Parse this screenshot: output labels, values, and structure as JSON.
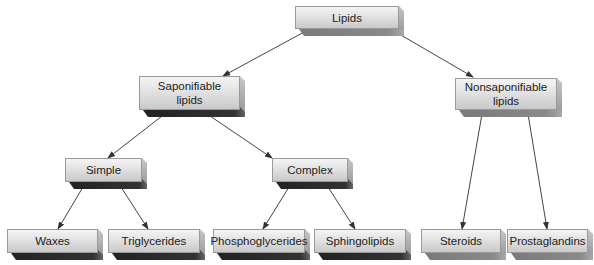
{
  "diagram": {
    "type": "hierarchy-tree",
    "root": "Lipids",
    "colors": {
      "face_top": "#f4f4f4",
      "face_bottom": "#c9c9c9",
      "dark_shadow": "#222222",
      "light_shadow": "#7a7a7a",
      "arrow": "#333333",
      "text": "#222222"
    },
    "nodes": {
      "lipids": {
        "label": "Lipids"
      },
      "saponifiable": {
        "label_line1": "Saponifiable",
        "label_line2": "lipids"
      },
      "nonsaponifiable": {
        "label_line1": "Nonsaponifiable",
        "label_line2": "lipids"
      },
      "simple": {
        "label": "Simple"
      },
      "complex": {
        "label": "Complex"
      },
      "waxes": {
        "label": "Waxes"
      },
      "triglycerides": {
        "label": "Triglycerides"
      },
      "phosphoglycerides": {
        "label": "Phosphoglycerides"
      },
      "sphingolipids": {
        "label": "Sphingolipids"
      },
      "steroids": {
        "label": "Steroids"
      },
      "prostaglandins": {
        "label": "Prostaglandins"
      }
    },
    "edges": [
      [
        "Lipids",
        "Saponifiable lipids"
      ],
      [
        "Lipids",
        "Nonsaponifiable lipids"
      ],
      [
        "Saponifiable lipids",
        "Simple"
      ],
      [
        "Saponifiable lipids",
        "Complex"
      ],
      [
        "Simple",
        "Waxes"
      ],
      [
        "Simple",
        "Triglycerides"
      ],
      [
        "Complex",
        "Phosphoglycerides"
      ],
      [
        "Complex",
        "Sphingolipids"
      ],
      [
        "Nonsaponifiable lipids",
        "Steroids"
      ],
      [
        "Nonsaponifiable lipids",
        "Prostaglandins"
      ]
    ]
  }
}
